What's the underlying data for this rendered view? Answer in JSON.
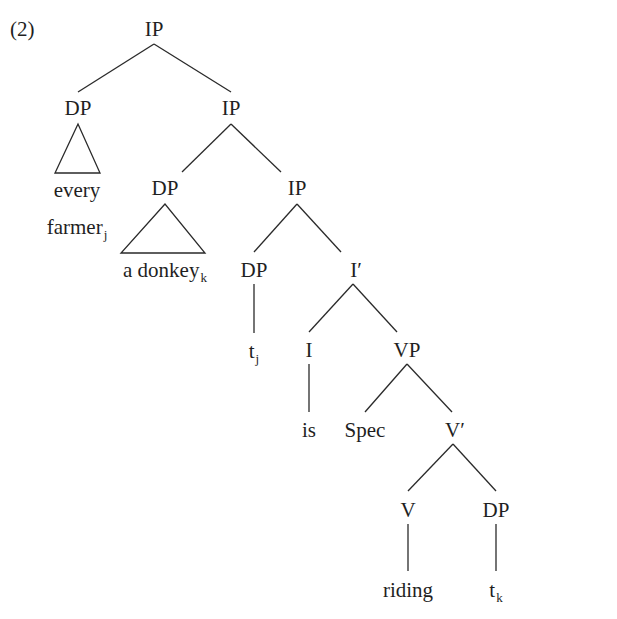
{
  "example_number": "(2)",
  "colors": {
    "ink": "#1f1f1f",
    "line": "#2a2a2a",
    "background": "#ffffff"
  },
  "tree": {
    "nodes": [
      {
        "id": "ip-root",
        "label": "IP",
        "sub": "",
        "x": 154,
        "y": 36,
        "type": "category"
      },
      {
        "id": "dp-1",
        "label": "DP",
        "sub": "",
        "x": 78,
        "y": 115,
        "type": "category"
      },
      {
        "id": "ip-2",
        "label": "IP",
        "sub": "",
        "x": 231,
        "y": 115,
        "type": "category"
      },
      {
        "id": "every",
        "label": "every",
        "sub": "",
        "x": 77,
        "y": 197,
        "type": "word"
      },
      {
        "id": "farmer",
        "label": "farmer",
        "sub": "j",
        "x": 77,
        "y": 234,
        "type": "word"
      },
      {
        "id": "dp-2",
        "label": "DP",
        "sub": "",
        "x": 165,
        "y": 195,
        "type": "category"
      },
      {
        "id": "ip-3",
        "label": "IP",
        "sub": "",
        "x": 297,
        "y": 195,
        "type": "category"
      },
      {
        "id": "donkey",
        "label": "a donkey",
        "sub": "k",
        "x": 165,
        "y": 277,
        "type": "word"
      },
      {
        "id": "dp-3",
        "label": "DP",
        "sub": "",
        "x": 254,
        "y": 277,
        "type": "category"
      },
      {
        "id": "i-bar",
        "label": "I′",
        "sub": "",
        "x": 356,
        "y": 277,
        "type": "category"
      },
      {
        "id": "trace-j",
        "label": "t",
        "sub": "j",
        "x": 254,
        "y": 358,
        "type": "word"
      },
      {
        "id": "i-head",
        "label": "I",
        "sub": "",
        "x": 309,
        "y": 357,
        "type": "category"
      },
      {
        "id": "vp",
        "label": "VP",
        "sub": "",
        "x": 407,
        "y": 357,
        "type": "category"
      },
      {
        "id": "is",
        "label": "is",
        "sub": "",
        "x": 309,
        "y": 437,
        "type": "word"
      },
      {
        "id": "spec",
        "label": "Spec",
        "sub": "",
        "x": 365,
        "y": 437,
        "type": "category"
      },
      {
        "id": "v-bar",
        "label": "V′",
        "sub": "",
        "x": 455,
        "y": 437,
        "type": "category"
      },
      {
        "id": "v-head",
        "label": "V",
        "sub": "",
        "x": 408,
        "y": 517,
        "type": "category"
      },
      {
        "id": "dp-4",
        "label": "DP",
        "sub": "",
        "x": 496,
        "y": 517,
        "type": "category"
      },
      {
        "id": "riding",
        "label": "riding",
        "sub": "",
        "x": 408,
        "y": 597,
        "type": "word"
      },
      {
        "id": "trace-k",
        "label": "t",
        "sub": "k",
        "x": 496,
        "y": 597,
        "type": "word"
      }
    ],
    "edges": [
      {
        "from": "ip-root",
        "to": "dp-1",
        "x1": 154,
        "y1": 44,
        "x2": 78,
        "y2": 92
      },
      {
        "from": "ip-root",
        "to": "ip-2",
        "x1": 154,
        "y1": 44,
        "x2": 231,
        "y2": 92
      },
      {
        "from": "ip-2",
        "to": "dp-2",
        "x1": 231,
        "y1": 124,
        "x2": 182,
        "y2": 172
      },
      {
        "from": "ip-2",
        "to": "ip-3",
        "x1": 231,
        "y1": 124,
        "x2": 281,
        "y2": 172
      },
      {
        "from": "ip-3",
        "to": "dp-3",
        "x1": 297,
        "y1": 204,
        "x2": 254,
        "y2": 252
      },
      {
        "from": "ip-3",
        "to": "i-bar",
        "x1": 297,
        "y1": 204,
        "x2": 341,
        "y2": 252
      },
      {
        "from": "dp-3",
        "to": "trace-j",
        "x1": 254,
        "y1": 284,
        "x2": 254,
        "y2": 333
      },
      {
        "from": "i-bar",
        "to": "i-head",
        "x1": 353,
        "y1": 284,
        "x2": 309,
        "y2": 332
      },
      {
        "from": "i-bar",
        "to": "vp",
        "x1": 353,
        "y1": 284,
        "x2": 397,
        "y2": 332
      },
      {
        "from": "i-head",
        "to": "is",
        "x1": 309,
        "y1": 364,
        "x2": 309,
        "y2": 412
      },
      {
        "from": "vp",
        "to": "spec",
        "x1": 407,
        "y1": 364,
        "x2": 365,
        "y2": 412
      },
      {
        "from": "vp",
        "to": "v-bar",
        "x1": 407,
        "y1": 364,
        "x2": 452,
        "y2": 412
      },
      {
        "from": "v-bar",
        "to": "v-head",
        "x1": 453,
        "y1": 444,
        "x2": 408,
        "y2": 491
      },
      {
        "from": "v-bar",
        "to": "dp-4",
        "x1": 453,
        "y1": 444,
        "x2": 496,
        "y2": 491
      },
      {
        "from": "v-head",
        "to": "riding",
        "x1": 408,
        "y1": 524,
        "x2": 408,
        "y2": 571
      },
      {
        "from": "dp-4",
        "to": "trace-k",
        "x1": 496,
        "y1": 524,
        "x2": 496,
        "y2": 571
      }
    ],
    "triangles": [
      {
        "parent": "dp-1",
        "covers": "every farmer",
        "points": "78,124 55,173 100,173"
      },
      {
        "parent": "dp-2",
        "covers": "a donkey",
        "points": "165,204 121,253 205,253"
      }
    ]
  }
}
